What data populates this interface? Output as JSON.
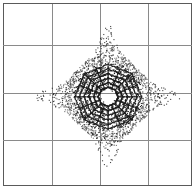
{
  "figure": {
    "title": "",
    "width": 196,
    "height": 193,
    "background_color": "#ffffff"
  },
  "plot_area": {
    "x": 3,
    "y": 3,
    "width": 189,
    "height": 183,
    "border_color": "#5a5a5a",
    "border_width": 1
  },
  "grid": {
    "color": "#8a8a8a",
    "line_width": 1,
    "columns": 4,
    "rows": 4,
    "vertical_positions": [
      0,
      49,
      97,
      145,
      189
    ],
    "horizontal_positions": [
      0,
      42,
      90,
      137,
      183
    ]
  },
  "chart_data": {
    "type": "scatter",
    "title": "",
    "xlabel": "",
    "ylabel": "",
    "xlim": [
      -4,
      4
    ],
    "ylim": [
      -4,
      4
    ],
    "grid": true,
    "legend": false,
    "marker_color": "#1a1a1a",
    "marker_size": 1.1,
    "center": {
      "x": 0.45,
      "y": -0.1
    },
    "structure": {
      "hollow_core_radius": 0.28,
      "ring_count": 6,
      "ring_radii": [
        0.42,
        0.62,
        0.82,
        1.02,
        1.22,
        1.42
      ],
      "ring_sides": 8,
      "diamond_half_extent": 1.75,
      "spike_length": 3.1,
      "spike_directions": [
        "up",
        "down",
        "left",
        "right"
      ],
      "density_falloff": 2.6,
      "total_points": 4200
    },
    "series": [
      {
        "name": "rings",
        "points": 1500
      },
      {
        "name": "diamond-cloud",
        "points": 2100
      },
      {
        "name": "spikes",
        "points": 600
      }
    ]
  }
}
